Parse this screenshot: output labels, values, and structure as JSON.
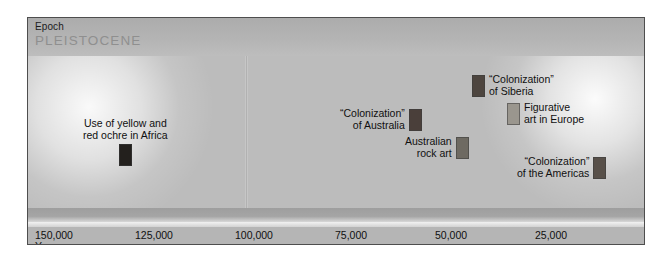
{
  "figure": {
    "epoch_header_label": "Epoch",
    "epoch_name": "PLEISTOCENE",
    "axis_sublabel": "Years ago"
  },
  "chart_data": {
    "type": "timeline",
    "title": "",
    "xlabel": "Years ago",
    "ylabel": "",
    "xlim": [
      155000,
      12000
    ],
    "x_reversed": true,
    "grid": false,
    "legend": "none",
    "epoch_bands": [
      {
        "label": "PLEISTOCENE",
        "header": "Epoch"
      }
    ],
    "tick_labels": [
      "150,000",
      "125,000",
      "100,000",
      "75,000",
      "50,000",
      "25,000"
    ],
    "tick_values": [
      150000,
      125000,
      100000,
      75000,
      50000,
      25000
    ],
    "divider_value": 100000,
    "events": [
      {
        "label": "Use of yellow and\nred ochre in Africa",
        "x_value": 130000,
        "swatch_color": "#23201d",
        "swatch_layout": "below",
        "text_align": "center"
      },
      {
        "label": "“Colonization”\nof Australia",
        "x_value": 66000,
        "swatch_color": "#4a3f3a",
        "swatch_layout": "right",
        "text_align": "right"
      },
      {
        "label": "Australian\nrock art",
        "x_value": 52000,
        "swatch_color": "#6e6a62",
        "swatch_layout": "right",
        "text_align": "right"
      },
      {
        "label": "“Colonization”\nof Siberia",
        "x_value": 33000,
        "swatch_color": "#4d453f",
        "swatch_layout": "left",
        "text_align": "left"
      },
      {
        "label": "Figurative\nart in Europe",
        "x_value": 25000,
        "swatch_color": "#9a968e",
        "swatch_layout": "left",
        "text_align": "left"
      },
      {
        "label": "“Colonization”\nof the Americas",
        "x_value": 21000,
        "swatch_color": "#585049",
        "swatch_layout": "right",
        "text_align": "right"
      }
    ]
  }
}
